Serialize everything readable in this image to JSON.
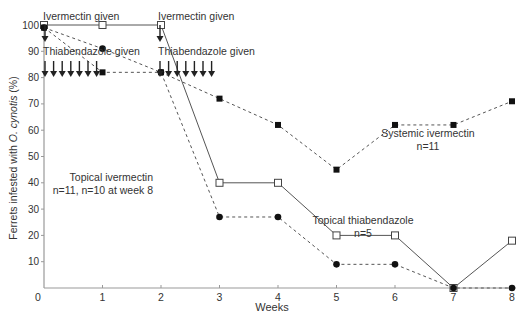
{
  "chart_data": {
    "type": "line",
    "title": "",
    "xlabel": "Weeks",
    "ylabel": "Ferrets infested with O. cynotis (%)",
    "ylabel_parts": {
      "pre": "Ferrets infested with ",
      "italic": "O. cynotis",
      "post": " (%)"
    },
    "x": [
      0,
      1,
      2,
      3,
      4,
      5,
      6,
      7,
      8
    ],
    "x_ticks": [
      "0",
      "1",
      "2",
      "3",
      "4",
      "5",
      "6",
      "7",
      "8"
    ],
    "y_ticks": [
      "10",
      "20",
      "30",
      "40",
      "50",
      "60",
      "70",
      "80",
      "90",
      "100"
    ],
    "xlim": [
      0,
      8
    ],
    "ylim": [
      0,
      100
    ],
    "grid": false,
    "series": [
      {
        "name": "Topical thiabendazole",
        "n_label": "n=5",
        "marker": "open-square",
        "line": "solid",
        "values": [
          100,
          100,
          100,
          40,
          40,
          20,
          20,
          0,
          18
        ]
      },
      {
        "name": "Topical ivermectin",
        "n_label": "n=11, n=10 at week 8",
        "marker": "filled-circle",
        "line": "dashed",
        "values": [
          99,
          91,
          82,
          27,
          27,
          9,
          9,
          0,
          0
        ]
      },
      {
        "name": "Systemic ivermectin",
        "n_label": "n=11",
        "marker": "filled-square",
        "line": "dashed",
        "values": [
          99,
          82,
          82,
          72,
          62,
          45,
          62,
          62,
          71
        ]
      }
    ],
    "annotations": [
      {
        "text": "Ivermectin given",
        "week": 0
      },
      {
        "text": "Thiabendazole given",
        "weeks_range": [
          0,
          1
        ]
      },
      {
        "text": "Ivermectin given",
        "week": 2
      },
      {
        "text": "Thiabendazole given",
        "weeks_range": [
          2,
          3
        ]
      }
    ],
    "colors": {
      "axis": "#999999",
      "line": "#555555",
      "marker": "#111111",
      "text": "#333333"
    }
  }
}
